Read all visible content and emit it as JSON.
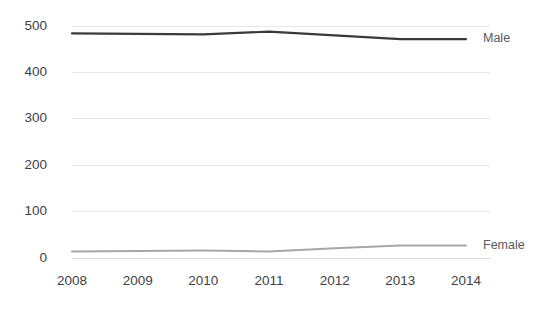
{
  "chart_data": {
    "type": "line",
    "title": "",
    "subtitle": "",
    "xlabel": "",
    "ylabel": "",
    "categories": [
      "2008",
      "2009",
      "2010",
      "2011",
      "2012",
      "2013",
      "2014"
    ],
    "x": [
      2008,
      2009,
      2010,
      2011,
      2012,
      2013,
      2014
    ],
    "series": [
      {
        "name": "Male",
        "color": "#3a3a3a",
        "values": [
          485,
          484,
          483,
          489,
          481,
          473,
          473
        ]
      },
      {
        "name": "Female",
        "color": "#a6a6a6",
        "values": [
          15,
          16,
          17,
          15,
          22,
          28,
          28
        ]
      }
    ],
    "ylim": [
      0,
      500
    ],
    "ytick_labels": [
      "0",
      "100",
      "200",
      "300",
      "400",
      "500"
    ],
    "ytick_values": [
      0,
      100,
      200,
      300,
      400,
      500
    ],
    "grid": true,
    "grid_axis": "y",
    "legend": "none",
    "series_labels_position": "right-of-line-end",
    "background_color": "#ffffff",
    "gridline_color": "#e8e8e8",
    "tick_label_color": "#3f3f3f",
    "series_label_color": "#5a5a5a"
  },
  "labels": {
    "male": "Male",
    "female": "Female"
  }
}
